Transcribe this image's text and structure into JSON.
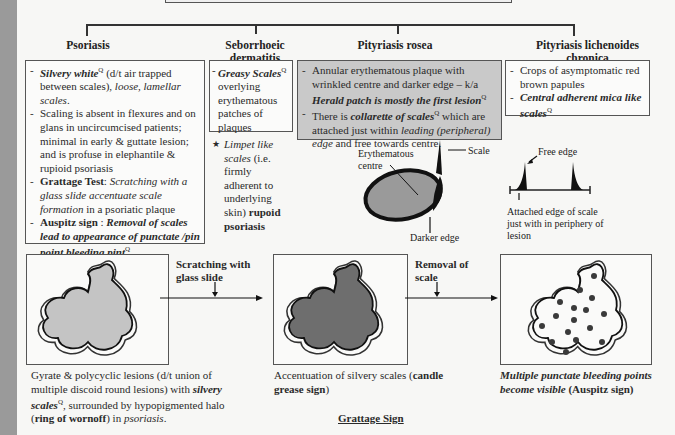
{
  "diagram": {
    "columns": [
      {
        "title": "Psoriasis",
        "items": [
          {
            "parts": [
              {
                "t": "Silvery white",
                "s": "bi"
              },
              {
                "t": "Q",
                "s": "sup"
              },
              {
                "t": " (d/t air trapped between scales), ",
                "s": ""
              },
              {
                "t": "loose, lamellar scales",
                "s": "i"
              },
              {
                "t": ".",
                "s": ""
              }
            ]
          },
          {
            "parts": [
              {
                "t": "Scaling is absent in flexures and on glans in uncircumcised patients; minimal in early & guttate lesion; and is profuse in elephantile & rupioid psoriasis",
                "s": ""
              }
            ]
          },
          {
            "parts": [
              {
                "t": "Grattage Test",
                "s": "b"
              },
              {
                "t": ": ",
                "s": ""
              },
              {
                "t": "Scratching with a glass slide accentuate scale formation",
                "s": "i"
              },
              {
                "t": " in a psoriatic plaque",
                "s": ""
              }
            ]
          },
          {
            "parts": [
              {
                "t": "Auspitz sign",
                "s": "b"
              },
              {
                "t": " : ",
                "s": ""
              },
              {
                "t": "Removal of scales lead to appearance of punctate /pin point bleeding pint",
                "s": "bi"
              },
              {
                "t": "Q",
                "s": "sup"
              },
              {
                "t": ".",
                "s": ""
              }
            ]
          }
        ]
      },
      {
        "title": "Seborrhoeic dermatitis",
        "items": [
          {
            "parts": [
              {
                "t": "Greasy Scales",
                "s": "bi"
              },
              {
                "t": "Q",
                "s": "sup"
              },
              {
                "t": " overlying erythematous patches of plaques",
                "s": ""
              }
            ]
          }
        ],
        "note": {
          "marker": "★",
          "parts": [
            {
              "t": "Limpet like scales",
              "s": "i"
            },
            {
              "t": " (i.e. firmly adherent to underlying skin) ",
              "s": ""
            },
            {
              "t": "rupoid psoriasis",
              "s": "b"
            }
          ]
        }
      },
      {
        "title": "Pityriasis rosea",
        "items": [
          {
            "parts": [
              {
                "t": "Annular erythematous plaque with wrinkled centre and darker edge – k/a ",
                "s": ""
              },
              {
                "t": "Herald patch is mostly the first lesion",
                "s": "bi"
              },
              {
                "t": "Q",
                "s": "sup"
              }
            ]
          },
          {
            "parts": [
              {
                "t": "There is ",
                "s": ""
              },
              {
                "t": "collarette of scales",
                "s": "bi"
              },
              {
                "t": "Q",
                "s": "sup"
              },
              {
                "t": " which are attached just within ",
                "s": ""
              },
              {
                "t": "leading (peripheral) edge",
                "s": "i"
              },
              {
                "t": " and free towards centre.",
                "s": ""
              }
            ]
          }
        ]
      },
      {
        "title": "Pityriasis lichenoides chronica",
        "items": [
          {
            "parts": [
              {
                "t": "Crops of asymptomatic red brown papules",
                "s": ""
              }
            ]
          },
          {
            "parts": [
              {
                "t": "Central adherent mica like scales",
                "s": "bi"
              },
              {
                "t": "Q",
                "s": "sup"
              }
            ]
          }
        ]
      }
    ],
    "herald_labels": {
      "centre": "Erythematous centre",
      "scale": "Scale",
      "edge": "Darker edge"
    },
    "scale_labels": {
      "free": "Free edge",
      "attached": "Attached edge of scale just with in periphery of lesion"
    },
    "grattage": {
      "arrow1": "Scratching with glass slide",
      "arrow2": "Removal of scale",
      "caption1": [
        {
          "t": "Gyrate & polycyclic lesions (d/t union of multiple discoid round lesions) with ",
          "s": ""
        },
        {
          "t": "silvery scales",
          "s": "bi"
        },
        {
          "t": "Q",
          "s": "sup"
        },
        {
          "t": ", surrounded by hypopigmented halo (",
          "s": ""
        },
        {
          "t": "ring of wornoff",
          "s": "b"
        },
        {
          "t": ") in ",
          "s": ""
        },
        {
          "t": "psoriasis",
          "s": "i"
        },
        {
          "t": ".",
          "s": ""
        }
      ],
      "caption2": [
        {
          "t": "Accentuation of silvery scales (",
          "s": ""
        },
        {
          "t": "candle grease sign",
          "s": "b"
        },
        {
          "t": ")",
          "s": ""
        }
      ],
      "caption3": [
        {
          "t": "Multiple punctate bleeding points become visible",
          "s": "bi"
        },
        {
          "t": " ",
          "s": ""
        },
        {
          "t": "(Auspitz sign)",
          "s": "b"
        }
      ],
      "footer": "Grattage Sign"
    },
    "colors": {
      "lesion_light": "#c4c4c4",
      "lesion_dark": "#6e6e6e",
      "herald_fill": "#9a9a9a",
      "gray_box": "#c9c9c9",
      "bleed_dot": "#3a3a3a"
    }
  }
}
